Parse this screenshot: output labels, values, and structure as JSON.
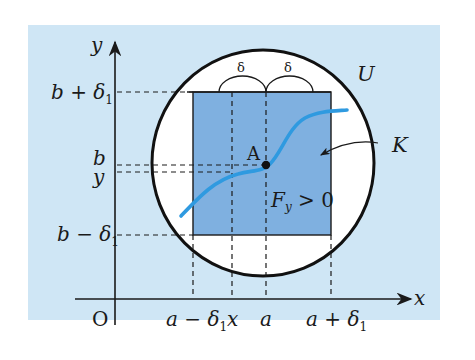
{
  "colors": {
    "background": "#cfe6f5",
    "set_K_fill": "#7fb0e0",
    "neighborhood_fill": "#ffffff",
    "curve": "#2f9ae0",
    "axis": "#1a1a1a"
  },
  "axes": {
    "x_label": "x",
    "y_label": "y",
    "origin_label": "O"
  },
  "x_ticks": [
    {
      "label_main": "a − δ",
      "sub": "1",
      "x": 193
    },
    {
      "label_main": "x",
      "sub": "",
      "x": 232
    },
    {
      "label_main": "a",
      "sub": "",
      "x": 266
    },
    {
      "label_main": "a + δ",
      "sub": "1",
      "x": 331
    }
  ],
  "y_ticks": [
    {
      "label_main": "b + δ",
      "sub": "1",
      "y": 92
    },
    {
      "label_main": "b",
      "sub": "",
      "y": 165
    },
    {
      "label_main": "y",
      "sub": "",
      "y": 172
    },
    {
      "label_main": "b − δ",
      "sub": "1",
      "y": 235
    }
  ],
  "labels": {
    "U": "U",
    "K": "K",
    "point_A": "A",
    "condition_F": "F",
    "condition_sub": "y",
    "condition_rest": " > 0",
    "delta_left": "δ",
    "delta_right": "δ"
  },
  "labels_tick": {
    "t0_main": "b + δ",
    "t0_sub": "1",
    "t1_main": "b",
    "t2_main": "y",
    "t3_main": "b − δ",
    "t3_sub": "1",
    "x0_main": "a − δ",
    "x0_sub": "1",
    "x1_main": "x",
    "x2_main": "a",
    "x3_main": "a + δ",
    "x3_sub": "1"
  }
}
